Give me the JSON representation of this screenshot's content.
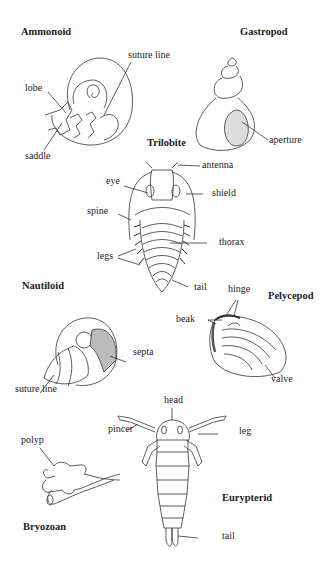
{
  "diagram": {
    "stroke_color": "#333333",
    "shade_color": "#9a9a9a",
    "background": "#ffffff",
    "specimens": [
      {
        "id": "ammonoid",
        "title": "Ammonoid",
        "labels": [
          "suture line",
          "lobe",
          "saddle"
        ]
      },
      {
        "id": "gastropod",
        "title": "Gastropod",
        "labels": [
          "aperture"
        ]
      },
      {
        "id": "trilobite",
        "title": "Trilobite",
        "labels": [
          "antenna",
          "eye",
          "shield",
          "spine",
          "thorax",
          "legs",
          "tail"
        ]
      },
      {
        "id": "nautiloid",
        "title": "Nautiloid",
        "labels": [
          "septa",
          "suture line"
        ]
      },
      {
        "id": "pelycepod",
        "title": "Pelycepod",
        "labels": [
          "hinge",
          "beak",
          "valve"
        ]
      },
      {
        "id": "eurypterid",
        "title": "Eurypterid",
        "labels": [
          "head",
          "pincer",
          "leg",
          "tail"
        ]
      },
      {
        "id": "bryozoan",
        "title": "Bryozoan",
        "labels": [
          "polyp"
        ]
      }
    ]
  }
}
